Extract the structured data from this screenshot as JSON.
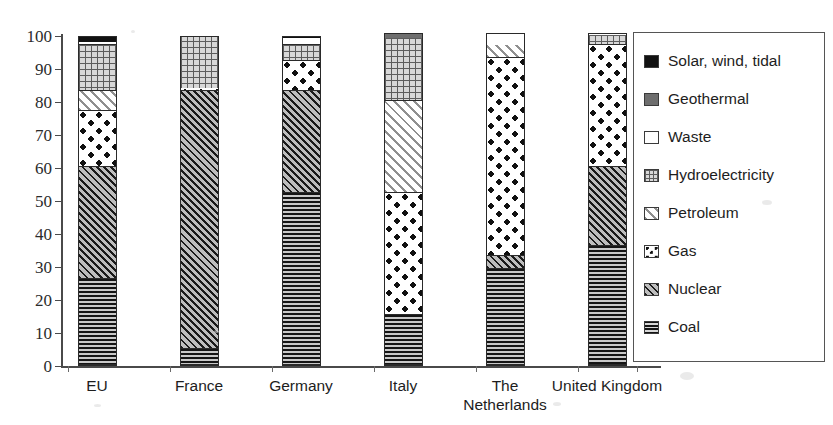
{
  "chart_data": {
    "type": "bar",
    "subtype": "stacked-100-percent",
    "title": "",
    "xlabel": "",
    "ylabel": "",
    "ylim": [
      0,
      100
    ],
    "yticks": [
      0,
      10,
      20,
      30,
      40,
      50,
      60,
      70,
      80,
      90,
      100
    ],
    "grid": false,
    "legend_position": "right",
    "categories": [
      "EU",
      "France",
      "Germany",
      "Italy",
      "The\nNetherlands",
      "United Kingdom"
    ],
    "series": [
      {
        "name": "Coal",
        "pattern": "horizontal-lines",
        "values": [
          26,
          5,
          52,
          15,
          29,
          36
        ]
      },
      {
        "name": "Nuclear",
        "pattern": "diagonal-hatch",
        "values": [
          34,
          78,
          31,
          0,
          4,
          24
        ]
      },
      {
        "name": "Gas",
        "pattern": "checker-dots",
        "values": [
          17,
          1,
          9,
          37,
          60,
          37
        ]
      },
      {
        "name": "Petroleum",
        "pattern": "light-diagonal",
        "values": [
          6,
          0,
          0,
          28,
          4,
          0
        ]
      },
      {
        "name": "Hydroelectricity",
        "pattern": "fine-grid",
        "values": [
          14,
          16,
          5,
          19,
          0,
          3
        ]
      },
      {
        "name": "Waste",
        "pattern": "white",
        "values": [
          1,
          0,
          2,
          0,
          4,
          1
        ]
      },
      {
        "name": "Geothermal",
        "pattern": "dark-grey",
        "values": [
          0,
          0,
          0,
          2,
          0,
          0
        ]
      },
      {
        "name": "Solar, wind, tidal",
        "pattern": "solid-black",
        "values": [
          2,
          0,
          1,
          0,
          0,
          0
        ]
      }
    ],
    "legend_entries": [
      {
        "label": "Solar, wind, tidal",
        "pattern": "solid-black"
      },
      {
        "label": "Geothermal",
        "pattern": "dark-grey"
      },
      {
        "label": "Waste",
        "pattern": "white"
      },
      {
        "label": "Hydroelectricity",
        "pattern": "fine-grid"
      },
      {
        "label": "Petroleum",
        "pattern": "light-diagonal"
      },
      {
        "label": "Gas",
        "pattern": "checker-dots"
      },
      {
        "label": "Nuclear",
        "pattern": "diagonal-hatch"
      },
      {
        "label": "Coal",
        "pattern": "horizontal-lines"
      }
    ],
    "stacks": [
      {
        "category": "EU",
        "segments": [
          {
            "name": "Coal",
            "from": 0,
            "to": 26
          },
          {
            "name": "Nuclear",
            "from": 26,
            "to": 60
          },
          {
            "name": "Gas",
            "from": 60,
            "to": 77
          },
          {
            "name": "Petroleum",
            "from": 77,
            "to": 83
          },
          {
            "name": "Hydroelectricity",
            "from": 83,
            "to": 97
          },
          {
            "name": "Waste",
            "from": 97,
            "to": 98
          },
          {
            "name": "Solar, wind, tidal",
            "from": 98,
            "to": 100
          }
        ]
      },
      {
        "category": "France",
        "segments": [
          {
            "name": "Coal",
            "from": 0,
            "to": 5
          },
          {
            "name": "Nuclear",
            "from": 5,
            "to": 83
          },
          {
            "name": "Gas",
            "from": 83,
            "to": 84
          },
          {
            "name": "Hydroelectricity",
            "from": 84,
            "to": 100
          }
        ]
      },
      {
        "category": "Germany",
        "segments": [
          {
            "name": "Coal",
            "from": 0,
            "to": 52
          },
          {
            "name": "Nuclear",
            "from": 52,
            "to": 83
          },
          {
            "name": "Gas",
            "from": 83,
            "to": 92
          },
          {
            "name": "Hydroelectricity",
            "from": 92,
            "to": 97
          },
          {
            "name": "Waste",
            "from": 97,
            "to": 99
          },
          {
            "name": "Solar, wind, tidal",
            "from": 99,
            "to": 100
          }
        ]
      },
      {
        "category": "Italy",
        "segments": [
          {
            "name": "Coal",
            "from": 0,
            "to": 15
          },
          {
            "name": "Gas",
            "from": 15,
            "to": 52
          },
          {
            "name": "Petroleum",
            "from": 52,
            "to": 80
          },
          {
            "name": "Hydroelectricity",
            "from": 80,
            "to": 99
          },
          {
            "name": "Geothermal",
            "from": 99,
            "to": 101
          }
        ]
      },
      {
        "category": "The Netherlands",
        "segments": [
          {
            "name": "Coal",
            "from": 0,
            "to": 29
          },
          {
            "name": "Nuclear",
            "from": 29,
            "to": 33
          },
          {
            "name": "Gas",
            "from": 33,
            "to": 93
          },
          {
            "name": "Petroleum",
            "from": 93,
            "to": 97
          },
          {
            "name": "Waste",
            "from": 97,
            "to": 101
          }
        ]
      },
      {
        "category": "United Kingdom",
        "segments": [
          {
            "name": "Coal",
            "from": 0,
            "to": 36
          },
          {
            "name": "Nuclear",
            "from": 36,
            "to": 60
          },
          {
            "name": "Gas",
            "from": 60,
            "to": 97
          },
          {
            "name": "Hydroelectricity",
            "from": 97,
            "to": 100
          },
          {
            "name": "Waste",
            "from": 100,
            "to": 101
          }
        ]
      }
    ]
  },
  "axis": {
    "y_tick_labels": [
      "100",
      "90",
      "80",
      "70",
      "60",
      "50",
      "40",
      "30",
      "20",
      "10",
      "0"
    ]
  }
}
